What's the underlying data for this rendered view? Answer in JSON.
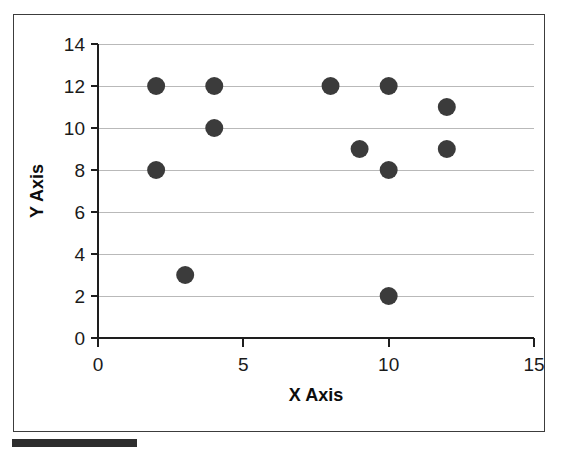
{
  "figure": {
    "background_color": "#ffffff",
    "frame_color": "#3c3c3c",
    "caption_bar_color": "#2e2e2e"
  },
  "chart_data": {
    "type": "scatter",
    "title": "",
    "xlabel": "X Axis",
    "ylabel": "Y Axis",
    "xlim": [
      0,
      15
    ],
    "ylim": [
      0,
      14
    ],
    "xticks": [
      0,
      5,
      10,
      15
    ],
    "yticks": [
      0,
      2,
      4,
      6,
      8,
      10,
      12,
      14
    ],
    "xtick_labels": [
      "0",
      "5",
      "10",
      "15"
    ],
    "ytick_labels": [
      "0",
      "2",
      "4",
      "6",
      "8",
      "10",
      "12",
      "14"
    ],
    "grid": true,
    "grid_axis": "y",
    "grid_color": "#b9b9b9",
    "legend": false,
    "marker": "circle",
    "marker_color": "#3b3b3b",
    "marker_size": 9,
    "points": [
      {
        "x": 2,
        "y": 12
      },
      {
        "x": 4,
        "y": 12
      },
      {
        "x": 8,
        "y": 12
      },
      {
        "x": 10,
        "y": 12
      },
      {
        "x": 12,
        "y": 11
      },
      {
        "x": 4,
        "y": 10
      },
      {
        "x": 9,
        "y": 9
      },
      {
        "x": 12,
        "y": 9
      },
      {
        "x": 2,
        "y": 8
      },
      {
        "x": 10,
        "y": 8
      },
      {
        "x": 3,
        "y": 3
      },
      {
        "x": 10,
        "y": 2
      }
    ]
  }
}
